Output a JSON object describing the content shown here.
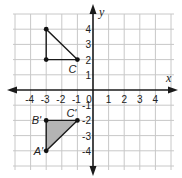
{
  "diagram": {
    "type": "coordinate-plane",
    "axes": {
      "x_label": "x",
      "y_label": "y",
      "x_range": [
        -4,
        4
      ],
      "y_range": [
        -4,
        4
      ],
      "x_ticks": [
        "-4",
        "-3",
        "-2",
        "-1",
        "0",
        "1",
        "2",
        "3",
        "4"
      ],
      "y_ticks_positive": [
        "1",
        "2",
        "3",
        "4"
      ],
      "y_ticks_negative": [
        "-1",
        "-2",
        "-3",
        "-4"
      ],
      "grid": true
    },
    "shapes": [
      {
        "name": "triangle-original",
        "filled": false,
        "fill_color": null,
        "vertices": [
          {
            "x": -3,
            "y": 4,
            "label": ""
          },
          {
            "x": -3,
            "y": 2,
            "label": ""
          },
          {
            "x": -1,
            "y": 2,
            "label": "C"
          }
        ]
      },
      {
        "name": "triangle-image",
        "filled": true,
        "fill_color": "#b4b4b4",
        "vertices": [
          {
            "x": -3,
            "y": -4,
            "label": "A'"
          },
          {
            "x": -3,
            "y": -2,
            "label": "B'"
          },
          {
            "x": -1,
            "y": -2,
            "label": "C'"
          }
        ]
      }
    ],
    "colors": {
      "grid": "#c8c8c8",
      "axis": "#1a1a1a",
      "image_fill": "#b4b4b4"
    }
  }
}
